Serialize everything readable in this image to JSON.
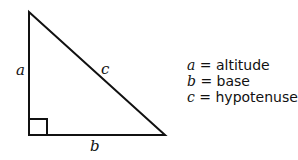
{
  "diagram": {
    "type": "right-triangle",
    "side_labels": {
      "altitude": "a",
      "base": "b",
      "hypotenuse": "c"
    },
    "legend": [
      {
        "var": "a",
        "eq": " = ",
        "meaning": "altitude"
      },
      {
        "var": "b",
        "eq": " = ",
        "meaning": "base"
      },
      {
        "var": "c",
        "eq": " = ",
        "meaning": "hypotenuse"
      }
    ]
  }
}
